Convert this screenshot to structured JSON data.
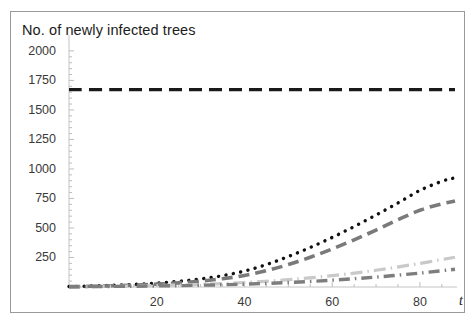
{
  "chart_data": {
    "type": "line",
    "title": "No. of newly infected trees",
    "xlabel": "t",
    "ylabel": "",
    "xlim": [
      0,
      88
    ],
    "ylim": [
      0,
      2050
    ],
    "xticks": [
      20,
      40,
      60,
      80
    ],
    "yticks": [
      250,
      500,
      750,
      1000,
      1250,
      1500,
      1750,
      2000
    ],
    "grid": false,
    "legend": "none",
    "frame": true,
    "series": [
      {
        "name": "no-control-black-dashed",
        "style": "dashed",
        "color": "#1a1a1a",
        "width": 3.2,
        "dasharray": "13,7",
        "x": [
          0,
          10,
          20,
          30,
          40,
          50,
          60,
          70,
          80,
          88
        ],
        "y": [
          1672,
          1672,
          1672,
          1672,
          1672,
          1672,
          1672,
          1672,
          1672,
          1672
        ]
      },
      {
        "name": "control-a-black-dotted",
        "style": "dotted",
        "color": "#111111",
        "width": 3.4,
        "dasharray": "0.1,7.4",
        "x": [
          0,
          5,
          10,
          15,
          20,
          25,
          30,
          35,
          40,
          45,
          50,
          55,
          60,
          65,
          70,
          75,
          80,
          85,
          88
        ],
        "y": [
          4,
          8,
          14,
          22,
          33,
          48,
          68,
          96,
          135,
          190,
          258,
          335,
          420,
          512,
          610,
          712,
          818,
          895,
          925
        ]
      },
      {
        "name": "control-b-dark-gray-dashed",
        "style": "dashed",
        "color": "#7a7a7a",
        "width": 3.6,
        "dasharray": "11,6",
        "x": [
          0,
          5,
          10,
          15,
          20,
          25,
          30,
          35,
          40,
          45,
          50,
          55,
          60,
          65,
          70,
          75,
          80,
          85,
          88
        ],
        "y": [
          3,
          6,
          10,
          16,
          24,
          35,
          50,
          70,
          98,
          138,
          190,
          252,
          322,
          400,
          482,
          570,
          650,
          705,
          728
        ]
      },
      {
        "name": "control-c-light-gray-dashdot",
        "style": "dashdot",
        "color": "#c9c9c9",
        "width": 3.2,
        "dasharray": "12,5,1.5,5",
        "x": [
          0,
          10,
          20,
          30,
          40,
          50,
          60,
          70,
          80,
          88
        ],
        "y": [
          2,
          6,
          12,
          22,
          38,
          62,
          96,
          142,
          200,
          252
        ]
      },
      {
        "name": "control-d-mid-gray-dashdot",
        "style": "dashdot",
        "color": "#7d7d7d",
        "width": 3.4,
        "dasharray": "11,5,1.5,5",
        "x": [
          0,
          10,
          20,
          30,
          40,
          50,
          60,
          70,
          80,
          88
        ],
        "y": [
          2,
          5,
          9,
          15,
          24,
          38,
          58,
          84,
          118,
          150
        ]
      }
    ]
  },
  "axes": {
    "y_tick_labels": [
      "2000",
      "1750",
      "1500",
      "1250",
      "1000",
      "750",
      "500",
      "250"
    ],
    "x_tick_labels": [
      "20",
      "40",
      "60",
      "80"
    ],
    "x_axis_label": "t"
  }
}
